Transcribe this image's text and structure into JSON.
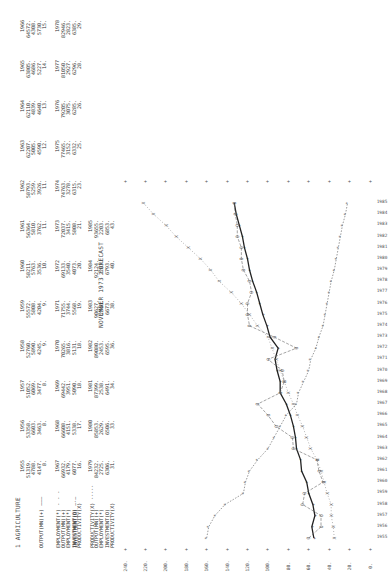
{
  "page": {
    "section_title": "1  AGRICULTURE",
    "forecast_title": "NOVEMBER 1973 FORECAST"
  },
  "legend": {
    "labels": [
      "OUTPUT(MN)(+) ———",
      "EMPLOYMENT(*) - - -",
      "INVESTMENT(O) —·—",
      "PRODUCTIVITY(X) ·····"
    ]
  },
  "tables": {
    "row_labels": [
      "OUTPUT(MN)(+)",
      "EMPLOYMENT(*)",
      "INVESTMENT(O)",
      "PRODUCTIVITY(X)"
    ],
    "block1": {
      "years": [
        "1955",
        "1956",
        "1957",
        "1958",
        "1959",
        "1960",
        "1961",
        "1962",
        "1963",
        "1964",
        "1965",
        "1966"
      ],
      "output": [
        "51319.",
        "53358.",
        "51052.",
        "52760.",
        "55572.",
        "58211.",
        "56364.",
        "58793.",
        "62207.",
        "62110.",
        "63805.",
        "64572."
      ],
      "employment": [
        "4788.",
        "6603.",
        "6069.",
        "5890.",
        "5808.",
        "5763.",
        "5810.",
        "5259.",
        "5005.",
        "4839.",
        "4686.",
        "4308."
      ],
      "investment": [
        "4147.",
        "3463.",
        "3477.",
        "4245.",
        "4204.",
        "3536.",
        "3762.",
        "3926.",
        "4590.",
        "4640.",
        "5227.",
        "5730."
      ],
      "productivity": [
        "8.",
        "8.",
        "8.",
        "9.",
        "9.",
        "10.",
        "11.",
        "11.",
        "12.",
        "13.",
        "14.",
        "15."
      ]
    },
    "block2": {
      "years": [
        "1967",
        "1968",
        "1969",
        "1970",
        "1971",
        "1972",
        "1973",
        "1974",
        "1975",
        "1976",
        "1977",
        "1978"
      ],
      "output": [
        "66932.",
        "66608.",
        "69442.",
        "70265.",
        "71755.",
        "69133.",
        "72037.",
        "74763.",
        "77465.",
        "79205.",
        "81050.",
        "82946."
      ],
      "employment": [
        "4179.",
        "4151.",
        "3951.",
        "3816.",
        "3744.",
        "3540.",
        "3415.",
        "3278.",
        "3152.",
        "3075.",
        "2927.",
        "2823."
      ],
      "investment": [
        "6077.",
        "5338.",
        "5090.",
        "5131.",
        "5568.",
        "4073.",
        "5808.",
        "6315.",
        "6332.",
        "6285.",
        "6296.",
        "6385."
      ],
      "productivity": [
        "16.",
        "17.",
        "18.",
        "18.",
        "19.",
        "20.",
        "21.",
        "23.",
        "25.",
        "26.",
        "28.",
        "29."
      ]
    },
    "block3": {
      "years": [
        "1979",
        "1980",
        "1981",
        "1982",
        "1983",
        "1984",
        "1985"
      ],
      "output": [
        "84232.",
        "85853.",
        "87399.",
        "89080.",
        "90627.",
        "92124.",
        "93655."
      ],
      "employment": [
        "2725.",
        "2629.",
        "2538.",
        "2453.",
        "2366.",
        "2283.",
        "2203."
      ],
      "investment": [
        "6306.",
        "6506.",
        "6491.",
        "6595.",
        "6673.",
        "6793.",
        "6853."
      ],
      "productivity": [
        "31.",
        "33.",
        "34.",
        "36.",
        "38.",
        "40.",
        "43."
      ]
    }
  },
  "chart_data": {
    "type": "line",
    "xlabel": "Year",
    "ylabel": "Index",
    "x": [
      1955,
      1956,
      1957,
      1958,
      1959,
      1960,
      1961,
      1962,
      1963,
      1964,
      1965,
      1966,
      1967,
      1968,
      1969,
      1970,
      1971,
      1972,
      1973,
      1974,
      1975,
      1976,
      1977,
      1978,
      1979,
      1980,
      1981,
      1982,
      1983,
      1984,
      1985
    ],
    "ylim": [
      0,
      240
    ],
    "y_ticks": [
      "0.",
      "20.",
      "40.",
      "60.",
      "80.",
      "100.",
      "120.",
      "140.",
      "160.",
      "180.",
      "200.",
      "220.",
      "240."
    ],
    "series": [
      {
        "name": "OUTPUT(MN)(+)",
        "marker": "+",
        "values": [
          55,
          57,
          54,
          56,
          60,
          62,
          67,
          68,
          72,
          73,
          75,
          78,
          82,
          88,
          88,
          91,
          93,
          90,
          98,
          101,
          105,
          108,
          111,
          115,
          118,
          120,
          123,
          125,
          128,
          131,
          133
        ]
      },
      {
        "name": "EMPLOYMENT(*)",
        "marker": "*",
        "values": [
          160,
          158,
          152,
          142,
          124,
          122,
          118,
          110,
          100,
          94,
          88,
          82,
          72,
          70,
          65,
          60,
          58,
          53,
          50,
          46,
          44,
          42,
          40,
          38,
          35,
          33,
          31,
          29,
          27,
          24,
          22
        ]
      },
      {
        "name": "INVESTMENT(O)",
        "marker": "O",
        "values": [
          60,
          48,
          48,
          66,
          64,
          46,
          50,
          52,
          75,
          76,
          92,
          100,
          110,
          88,
          84,
          86,
          100,
          72,
          94,
          118,
          120,
          120,
          116,
          118,
          124,
          126,
          126,
          130,
          130,
          132,
          133
        ]
      },
      {
        "name": "PRODUCTIVITY(X)",
        "marker": "X",
        "values": [
          35,
          36,
          38,
          38,
          42,
          45,
          48,
          52,
          58,
          62,
          66,
          71,
          75,
          80,
          84,
          88,
          92,
          96,
          100,
          110,
          118,
          126,
          136,
          148,
          156,
          166,
          178,
          190,
          200,
          212,
          222
        ]
      }
    ],
    "grid": false,
    "legend_position": "top-left"
  }
}
